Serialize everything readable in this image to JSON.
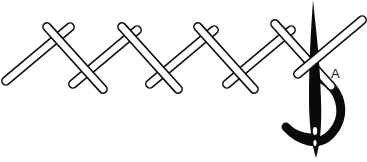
{
  "diagram": {
    "point_label": "A",
    "stitch_count": 8,
    "colors": {
      "outline": "#111111",
      "fill": "#ffffff",
      "needle": "#0a0a0a",
      "background": "#ffffff"
    }
  }
}
